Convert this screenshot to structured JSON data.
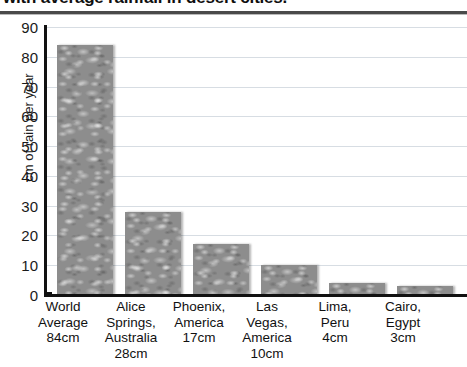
{
  "chart_data": {
    "type": "bar",
    "title": "with average rainfall in desert cities.",
    "xlabel": "",
    "ylabel": "cm of rain per year",
    "ylim": [
      0,
      90
    ],
    "ytick_step": 10,
    "yticks": [
      "90",
      "80",
      "70",
      "60",
      "50",
      "40",
      "30",
      "20",
      "10",
      "0"
    ],
    "grid": true,
    "legend": "none",
    "bar_fill": "water-droplet-texture",
    "bar_color": "#8d8d8d",
    "categories": [
      "World Average 84cm",
      "Alice Springs, Australia 28cm",
      "Phoenix, America 17cm",
      "Las Vegas, America 10cm",
      "Lima, Peru 4cm",
      "Cairo, Egypt 3cm"
    ],
    "values": [
      84,
      28,
      17,
      10,
      4,
      3
    ],
    "units": "cm"
  },
  "axis": {
    "y_title": "cm of rain per year"
  },
  "categories_multiline": [
    {
      "name": "world-average",
      "lines": [
        "World",
        "Average",
        "84cm"
      ],
      "value": 84
    },
    {
      "name": "alice-springs",
      "lines": [
        "Alice",
        "Springs,",
        "Australia",
        "28cm"
      ],
      "value": 28
    },
    {
      "name": "phoenix",
      "lines": [
        "Phoenix,",
        "America",
        "17cm"
      ],
      "value": 17
    },
    {
      "name": "las-vegas",
      "lines": [
        "Las",
        "Vegas,",
        "America",
        "10cm"
      ],
      "value": 10
    },
    {
      "name": "lima",
      "lines": [
        "Lima,",
        "Peru",
        "4cm"
      ],
      "value": 4
    },
    {
      "name": "cairo",
      "lines": [
        "Cairo,",
        "Egypt",
        "3cm"
      ],
      "value": 3
    }
  ],
  "colors": {
    "bar": "#8d8d8d",
    "gridline": "#d7dde3",
    "axis": "#111111",
    "text": "#1a1a1a",
    "background": "#ffffff"
  }
}
